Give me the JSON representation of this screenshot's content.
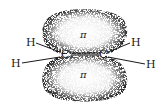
{
  "diagram": {
    "atoms": {
      "carbon_left": "C",
      "carbon_right": "C",
      "h_left_upper": "H",
      "h_left_lower": "H",
      "h_right_upper": "H",
      "h_right_lower": "H"
    },
    "orbital_labels": {
      "upper_lobe": "π",
      "lower_lobe": "π"
    },
    "colors": {
      "ink": "#1a1a1a",
      "background": "#ffffff"
    }
  }
}
